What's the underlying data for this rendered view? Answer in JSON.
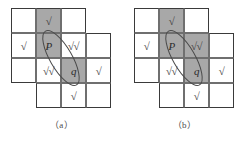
{
  "colors": {
    "shade": "#a8a8a8",
    "cell_background": "#ffffff",
    "grid_line": "#6f6f6f",
    "outline": "#3a3a3a",
    "mark_color": "#3b3b3b",
    "page_background": "#ffffff"
  },
  "figure_a": {
    "caption": "（a）",
    "grid": {
      "columns": 4,
      "rows": 4,
      "cell_size": 25,
      "cells": [
        {
          "col": 0,
          "row": 0,
          "shaded": false,
          "mark": ""
        },
        {
          "col": 1,
          "row": 0,
          "shaded": true,
          "mark": "√"
        },
        {
          "col": 2,
          "row": 0,
          "shaded": false,
          "mark": ""
        },
        {
          "col": 0,
          "row": 1,
          "shaded": false,
          "mark": "√"
        },
        {
          "col": 1,
          "row": 1,
          "shaded": true,
          "mark": "P"
        },
        {
          "col": 2,
          "row": 1,
          "shaded": false,
          "mark": "√√"
        },
        {
          "col": 3,
          "row": 1,
          "shaded": false,
          "mark": ""
        },
        {
          "col": 0,
          "row": 2,
          "shaded": false,
          "mark": ""
        },
        {
          "col": 1,
          "row": 2,
          "shaded": false,
          "mark": "√√"
        },
        {
          "col": 2,
          "row": 2,
          "shaded": true,
          "mark": "q"
        },
        {
          "col": 3,
          "row": 2,
          "shaded": false,
          "mark": "√"
        },
        {
          "col": 1,
          "row": 3,
          "shaded": false,
          "mark": ""
        },
        {
          "col": 2,
          "row": 3,
          "shaded": false,
          "mark": "√"
        },
        {
          "col": 3,
          "row": 3,
          "shaded": false,
          "mark": ""
        }
      ]
    },
    "ellipse": {
      "center_x": 50,
      "center_y": 50,
      "radius_x": 11,
      "radius_y": 31,
      "rotation_deg": -30
    }
  },
  "figure_b": {
    "caption": "（b）",
    "grid": {
      "columns": 4,
      "rows": 4,
      "cell_size": 25,
      "cells": [
        {
          "col": 0,
          "row": 0,
          "shaded": false,
          "mark": ""
        },
        {
          "col": 1,
          "row": 0,
          "shaded": true,
          "mark": "√"
        },
        {
          "col": 2,
          "row": 0,
          "shaded": false,
          "mark": ""
        },
        {
          "col": 0,
          "row": 1,
          "shaded": false,
          "mark": "√"
        },
        {
          "col": 1,
          "row": 1,
          "shaded": true,
          "mark": "P"
        },
        {
          "col": 2,
          "row": 1,
          "shaded": true,
          "mark": "√√"
        },
        {
          "col": 3,
          "row": 1,
          "shaded": false,
          "mark": ""
        },
        {
          "col": 0,
          "row": 2,
          "shaded": false,
          "mark": ""
        },
        {
          "col": 1,
          "row": 2,
          "shaded": false,
          "mark": "√√"
        },
        {
          "col": 2,
          "row": 2,
          "shaded": true,
          "mark": "q"
        },
        {
          "col": 3,
          "row": 2,
          "shaded": false,
          "mark": "√"
        },
        {
          "col": 1,
          "row": 3,
          "shaded": false,
          "mark": ""
        },
        {
          "col": 2,
          "row": 3,
          "shaded": false,
          "mark": "√"
        },
        {
          "col": 3,
          "row": 3,
          "shaded": false,
          "mark": ""
        }
      ]
    },
    "ellipse": {
      "center_x": 50,
      "center_y": 50,
      "radius_x": 11,
      "radius_y": 31,
      "rotation_deg": -30
    }
  }
}
